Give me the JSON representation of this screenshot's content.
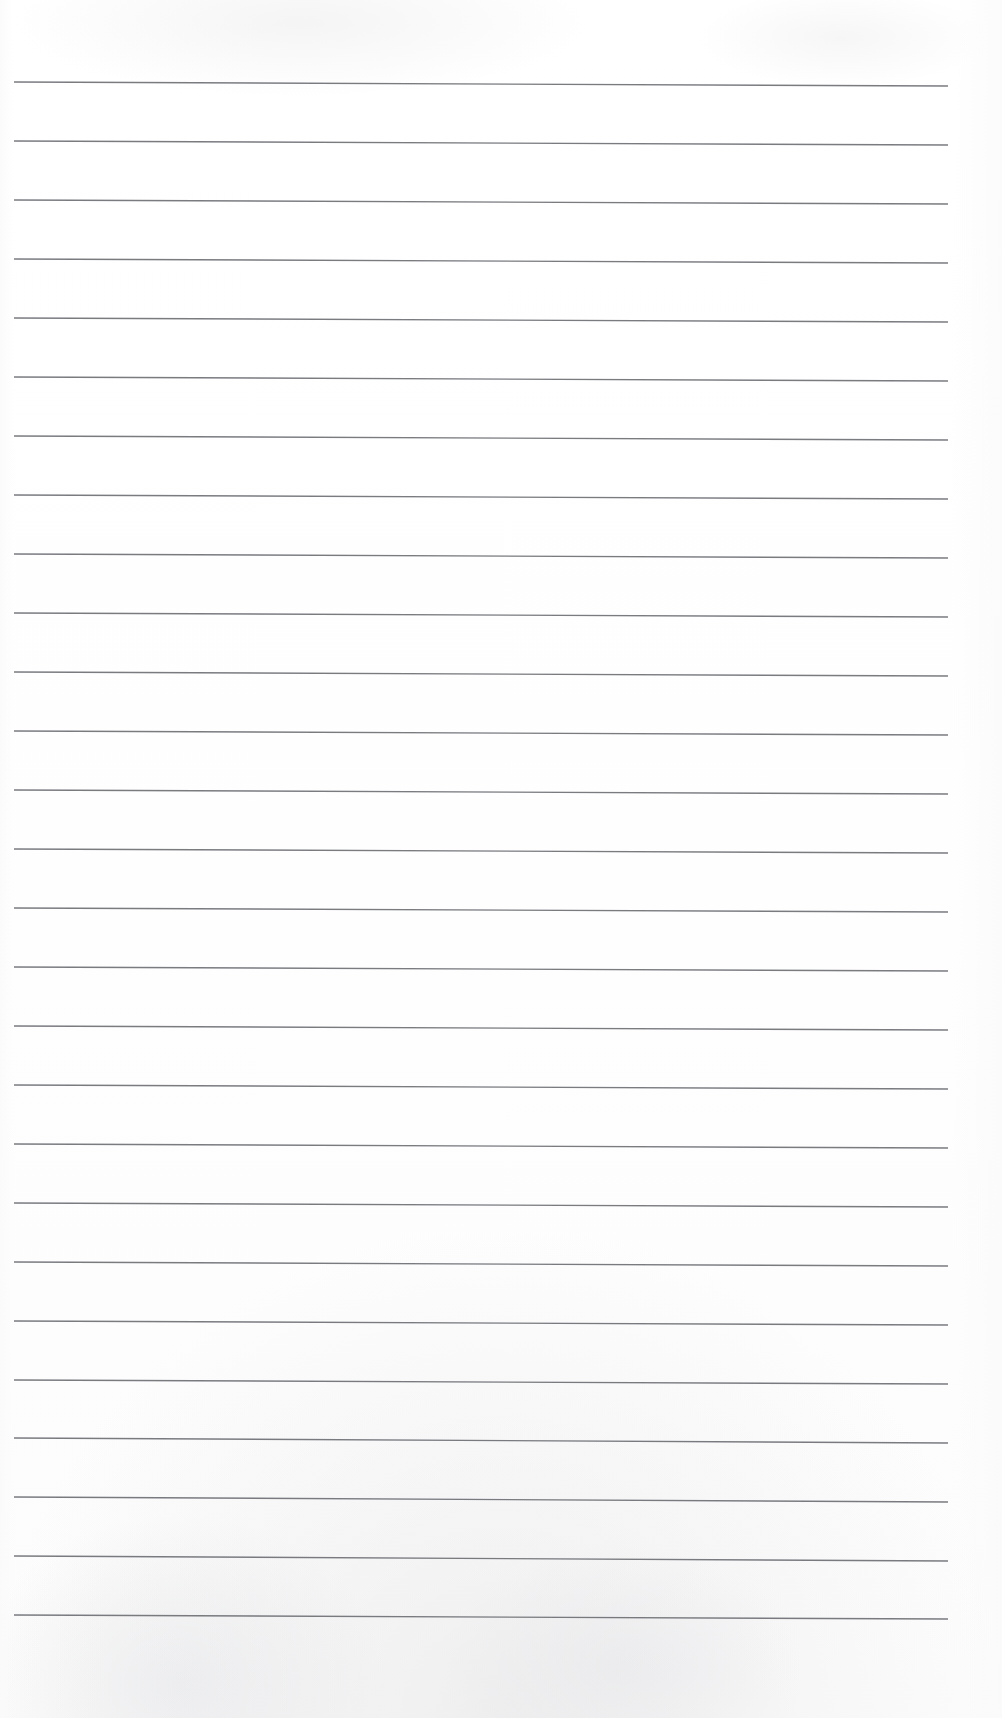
{
  "document": {
    "kind": "scanned-ruled-notebook-page",
    "title": "Blank Lined Paper",
    "content_text": "",
    "has_handwriting": false,
    "has_printed_text": false,
    "page_width_px": 1002,
    "page_height_px": 1718,
    "background_color": "#ffffff",
    "paper_tone_color": "#fcfcfc"
  },
  "ruling": {
    "name": "horizontal-ruling-lines",
    "line_color": "#6e7075",
    "line_count": 27,
    "line_thickness_px": 1.35,
    "line_spacing_px": 59,
    "first_line_y_px": 82,
    "last_line_y_px": 1615,
    "line_start_x_px": 14,
    "line_end_x_px": 948,
    "skew_drop_px": 4,
    "top_margin_px": 82,
    "bottom_margin_px": 103,
    "left_margin_px": 14,
    "right_margin_px": 54,
    "lines": [
      {
        "index": 1,
        "y_left": 82,
        "y_right": 86
      },
      {
        "index": 2,
        "y_left": 141,
        "y_right": 145
      },
      {
        "index": 3,
        "y_left": 200,
        "y_right": 204
      },
      {
        "index": 4,
        "y_left": 259,
        "y_right": 263
      },
      {
        "index": 5,
        "y_left": 318,
        "y_right": 322
      },
      {
        "index": 6,
        "y_left": 377,
        "y_right": 381
      },
      {
        "index": 7,
        "y_left": 436,
        "y_right": 440
      },
      {
        "index": 8,
        "y_left": 495,
        "y_right": 499
      },
      {
        "index": 9,
        "y_left": 554,
        "y_right": 558
      },
      {
        "index": 10,
        "y_left": 613,
        "y_right": 617
      },
      {
        "index": 11,
        "y_left": 672,
        "y_right": 676
      },
      {
        "index": 12,
        "y_left": 731,
        "y_right": 735
      },
      {
        "index": 13,
        "y_left": 790,
        "y_right": 794
      },
      {
        "index": 14,
        "y_left": 849,
        "y_right": 853
      },
      {
        "index": 15,
        "y_left": 908,
        "y_right": 912
      },
      {
        "index": 16,
        "y_left": 967,
        "y_right": 971
      },
      {
        "index": 17,
        "y_left": 1026,
        "y_right": 1030
      },
      {
        "index": 18,
        "y_left": 1085,
        "y_right": 1089
      },
      {
        "index": 19,
        "y_left": 1144,
        "y_right": 1148
      },
      {
        "index": 20,
        "y_left": 1203,
        "y_right": 1207
      },
      {
        "index": 21,
        "y_left": 1262,
        "y_right": 1266
      },
      {
        "index": 22,
        "y_left": 1321,
        "y_right": 1325
      },
      {
        "index": 23,
        "y_left": 1380,
        "y_right": 1384
      },
      {
        "index": 24,
        "y_left": 1438,
        "y_right": 1443
      },
      {
        "index": 25,
        "y_left": 1497,
        "y_right": 1502
      },
      {
        "index": 26,
        "y_left": 1556,
        "y_right": 1561
      },
      {
        "index": 27,
        "y_left": 1615,
        "y_right": 1619
      }
    ]
  }
}
